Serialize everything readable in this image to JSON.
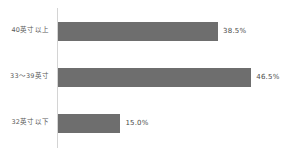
{
  "chart_data": {
    "type": "bar",
    "orientation": "horizontal",
    "title": "",
    "subtitle": "",
    "xlabel": "",
    "ylabel": "",
    "xlim": [
      0,
      55.8
    ],
    "grid": false,
    "legend": false,
    "bar_color": "#6e6e6e",
    "axis_color": "#d4d4d4",
    "label_color": "#5a5a5a",
    "value_color": "#4a4a4a",
    "categories": [
      "40英寸以上",
      "33～39英寸",
      "32英寸以下"
    ],
    "values": [
      38.5,
      46.5,
      15.0
    ],
    "value_labels": [
      "38.5%",
      "46.5%",
      "15.0%"
    ],
    "bars": [
      {
        "category": "40英寸以上",
        "value": 38.5,
        "value_label": "38.5%",
        "bar_width_px": 163
      },
      {
        "category": "33～39英寸",
        "value": 46.5,
        "value_label": "46.5%",
        "bar_width_px": 193
      },
      {
        "category": "32英寸以下",
        "value": 15.0,
        "value_label": "15.0%",
        "bar_width_px": 58
      }
    ]
  }
}
